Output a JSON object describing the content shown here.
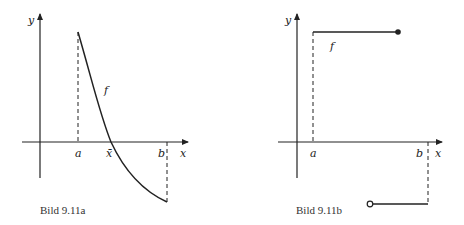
{
  "figures": [
    {
      "id": "a",
      "caption": "Bild 9.11a",
      "axis_labels": {
        "x": "x",
        "y": "y"
      },
      "tick_labels": {
        "a": "a",
        "xbar": "x̄",
        "b": "b"
      },
      "curve_label": "f",
      "description": "Continuous decreasing function f on [a,b], positive at a, negative at b, crossing zero at x̄"
    },
    {
      "id": "b",
      "caption": "Bild 9.11b",
      "axis_labels": {
        "x": "x",
        "y": "y"
      },
      "tick_labels": {
        "a": "a",
        "b": "b"
      },
      "curve_label": "f",
      "description": "Step function f: positive constant from a (closed dot at right end), jumps to negative constant (open dot at left end) up to b"
    }
  ],
  "colors": {
    "ink": "#222222",
    "background": "#ffffff"
  }
}
